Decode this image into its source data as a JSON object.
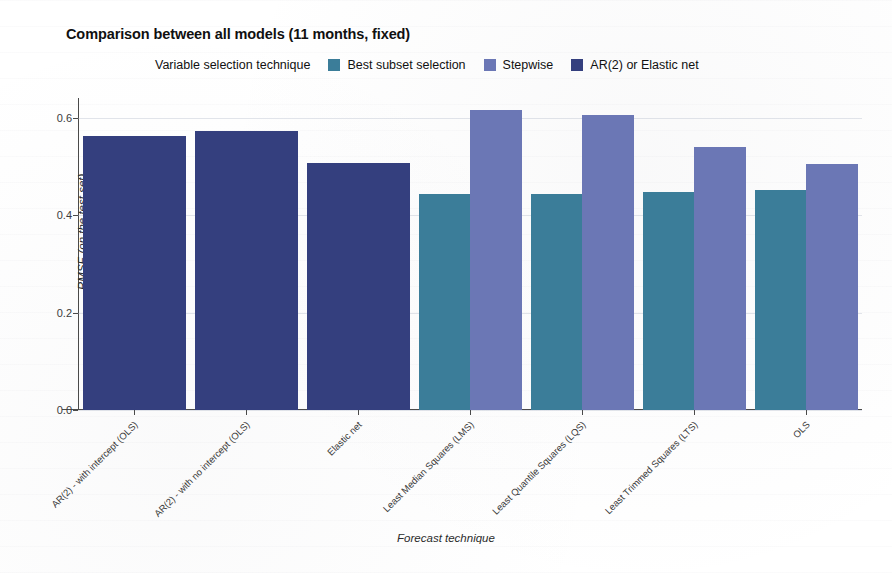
{
  "chart_data": {
    "type": "bar",
    "title": "Comparison between all models (11 months, fixed)",
    "xlabel": "Forecast technique",
    "ylabel": "RMSE (on the test set)",
    "ylim": [
      0.0,
      0.64
    ],
    "yticks": [
      0.0,
      0.2,
      0.4,
      0.6
    ],
    "ytick_labels": [
      "0.0",
      "0.2",
      "0.4",
      "0.6"
    ],
    "grid": true,
    "grid_axis": "y",
    "legend_title": "Variable selection technique",
    "legend_position": "top",
    "categories": [
      "AR(2) - with intercept (OLS)",
      "AR(2) - with no intercept (OLS)",
      "Elastic net",
      "Least Median Squares (LMS)",
      "Least Quantile Squares (LQS)",
      "Least Trimmed Squares (LTS)",
      "OLS"
    ],
    "series": [
      {
        "name": "Best subset selection",
        "color": "#3b7d99",
        "values": [
          null,
          null,
          null,
          0.443,
          0.443,
          0.447,
          0.452
        ]
      },
      {
        "name": "Stepwise",
        "color": "#6b77b5",
        "values": [
          null,
          null,
          null,
          0.615,
          0.605,
          0.54,
          0.505
        ]
      },
      {
        "name": "AR(2) or Elastic net",
        "color": "#343f7e",
        "values": [
          0.563,
          0.572,
          0.506,
          null,
          null,
          null,
          null
        ]
      }
    ]
  },
  "caption": ""
}
